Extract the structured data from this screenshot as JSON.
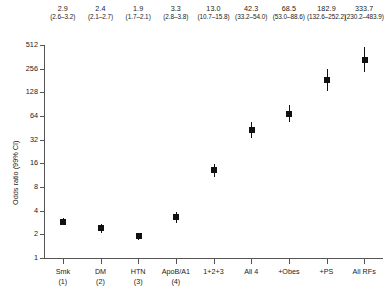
{
  "chart_data": {
    "type": "scatter",
    "title": "",
    "xlabel": "",
    "ylabel": "Odds ratio (99% CI)",
    "yscale": "log2",
    "ylim": [
      1,
      512
    ],
    "ytick_labels": [
      "1",
      "2",
      "4",
      "8",
      "16",
      "32",
      "64",
      "128",
      "256",
      "512"
    ],
    "ytick_values": [
      1,
      2,
      4,
      8,
      16,
      32,
      64,
      128,
      256,
      512
    ],
    "grid": false,
    "legend": "none",
    "categories": [
      "Smk (1)",
      "DM (2)",
      "HTN (3)",
      "ApoB/A1 (4)",
      "1+2+3",
      "All 4",
      "+Obes",
      "+PS",
      "All RFs"
    ],
    "values": [
      2.9,
      2.4,
      1.9,
      3.3,
      13.0,
      42.3,
      68.5,
      182.9,
      333.7
    ],
    "ci_low": [
      2.6,
      2.1,
      1.7,
      2.8,
      10.7,
      33.2,
      53.0,
      132.6,
      230.2
    ],
    "ci_high": [
      3.2,
      2.7,
      2.1,
      3.8,
      15.8,
      54.0,
      88.6,
      252.2,
      483.9
    ],
    "point_labels": [
      "2.9",
      "2.4",
      "1.9",
      "3.3",
      "13.0",
      "42.3",
      "68.5",
      "182.9",
      "333.7"
    ],
    "ci_labels": [
      "(2.6–3.2)",
      "(2.1–2.7)",
      "(1.7–2.1)",
      "(2.8–3.8)",
      "(10.7–15.8)",
      "(33.2–54.0)",
      "(53.0–88.6)",
      "(132.6–252.2)",
      "(230.2–483.9)"
    ],
    "xtick_labels_top": [
      "Smk",
      "DM",
      "HTN",
      "ApoB/A1",
      "1+2+3",
      "All 4",
      "+Obes",
      "+PS",
      "All RFs"
    ],
    "xtick_labels_bottom": [
      "(1)",
      "(2)",
      "(3)",
      "(4)",
      "",
      "",
      "",
      "",
      ""
    ],
    "marker_color": "#111111",
    "axis_color": "#555555"
  }
}
